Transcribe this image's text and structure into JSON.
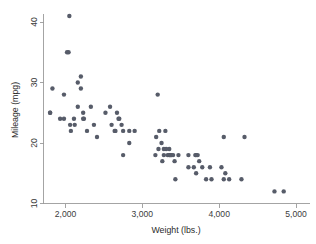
{
  "chart_data": {
    "type": "scatter",
    "title": "",
    "xlabel": "Weight (lbs.)",
    "ylabel": "Mileage (mpg)",
    "xlim": [
      1715,
      5045
    ],
    "ylim": [
      9.2,
      42.3
    ],
    "xticks": [
      2000,
      3000,
      4000,
      5000
    ],
    "xticklabels": [
      "2,000",
      "3,000",
      "4,000",
      "5,000"
    ],
    "yticks": [
      10,
      20,
      30,
      40
    ],
    "yticklabels": [
      "10",
      "20",
      "30",
      "40"
    ],
    "grid": false,
    "legend": null,
    "marker": {
      "shape": "circle",
      "color": "#575c69",
      "size_px": 4.4
    },
    "series": [
      {
        "name": "Automobiles",
        "x": [
          1800,
          1800,
          1830,
          1930,
          1980,
          1980,
          2020,
          2040,
          2050,
          2060,
          2070,
          2110,
          2120,
          2160,
          2160,
          2200,
          2200,
          2230,
          2230,
          2240,
          2280,
          2330,
          2370,
          2410,
          2520,
          2580,
          2600,
          2640,
          2650,
          2670,
          2690,
          2700,
          2730,
          2750,
          2750,
          2830,
          2830,
          2900,
          3170,
          3180,
          3200,
          3210,
          3220,
          3250,
          3260,
          3280,
          3280,
          3300,
          3310,
          3330,
          3350,
          3350,
          3360,
          3370,
          3380,
          3400,
          3420,
          3430,
          3470,
          3600,
          3600,
          3670,
          3690,
          3700,
          3700,
          3720,
          3740,
          3780,
          3830,
          3880,
          3900,
          4030,
          4060,
          4060,
          4080,
          4130,
          4290,
          4330,
          4720,
          4840
        ],
        "y": [
          25,
          25,
          29,
          24,
          28,
          24,
          35,
          35,
          41,
          23,
          22,
          24,
          23,
          30,
          26,
          31,
          29,
          25,
          24,
          24,
          22,
          26,
          23,
          21,
          25,
          26,
          23,
          22,
          22,
          25,
          24,
          24,
          23,
          22,
          18,
          22,
          20,
          22,
          18,
          21,
          28,
          19,
          22,
          20,
          17,
          19,
          18,
          22,
          19,
          18,
          18,
          19,
          18,
          18,
          18,
          18,
          17,
          14,
          18,
          18,
          16,
          16,
          18,
          15,
          18,
          18,
          17,
          16,
          14,
          16,
          14,
          16,
          21,
          14,
          15,
          14,
          14,
          21,
          12,
          12
        ]
      }
    ]
  }
}
